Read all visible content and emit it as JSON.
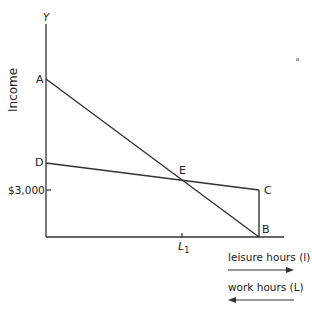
{
  "diagram": {
    "y_axis_symbol": "Y",
    "y_axis_label": "Income",
    "y_tick_label": "$3,000",
    "x_tick_label": "L",
    "x_tick_sub": "1",
    "points": {
      "A": "A",
      "B": "B",
      "C": "C",
      "D": "D",
      "E": "E"
    },
    "legend": {
      "leisure": "leisure hours (l)",
      "work": "work hours (L)"
    }
  }
}
